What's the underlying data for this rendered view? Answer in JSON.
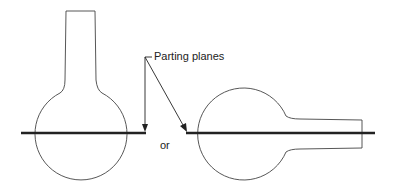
{
  "diagram": {
    "label_parting": "Parting planes",
    "label_or": "or",
    "colors": {
      "outline": "#444444",
      "parting_line": "#222222",
      "arrow": "#222222"
    }
  }
}
